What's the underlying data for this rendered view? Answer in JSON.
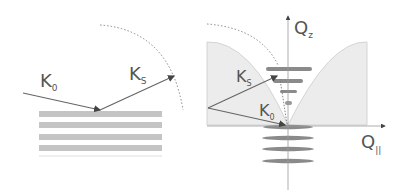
{
  "left_panel": {
    "incident_label": "K",
    "incident_sub": "0",
    "scattered_label": "K",
    "scattered_sub": "S",
    "layers": 4
  },
  "right_panel": {
    "qz_label": "Q",
    "qz_sub": "z",
    "qpar_label": "Q",
    "qpar_sub": "||",
    "ks_label": "K",
    "ks_sub": "S",
    "k0_label": "K",
    "k0_sub": "0"
  },
  "colors": {
    "line": "#666666",
    "layer_fill": "#bdbdbd",
    "region_fill": "#eeeeee",
    "ellipse_fill": "#8a8a8a",
    "text": "#555555"
  }
}
